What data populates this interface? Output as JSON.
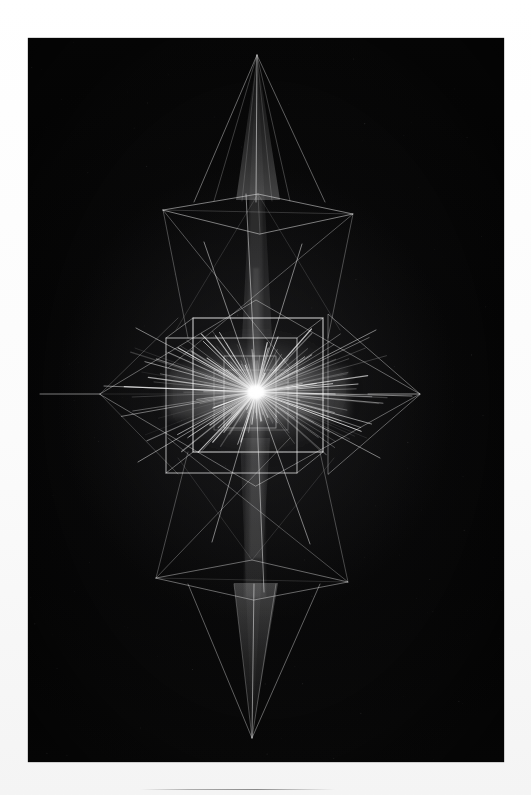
{
  "page": {
    "background_color": "#fdfdfd",
    "width": 531,
    "height": 795
  },
  "photo": {
    "name": "light-painting-photograph",
    "background_color": "#050505",
    "trail_color": "#ffffff",
    "frame": {
      "x": 28,
      "y": 38,
      "width": 476,
      "height": 724
    }
  },
  "paper_rule": {
    "x": 140,
    "y": 789,
    "width": 195
  },
  "chart_data": {
    "type": "scatter",
    "title": "",
    "xlabel": "",
    "ylabel": "",
    "center": {
      "x": 256,
      "y": 392
    },
    "vertices": {
      "top_apex": {
        "x": 257,
        "y": 55
      },
      "bottom_apex": {
        "x": 252,
        "y": 738
      },
      "left_vertex": {
        "x": 100,
        "y": 394
      },
      "right_vertex": {
        "x": 420,
        "y": 393
      },
      "upper_ring_y": 200,
      "lower_ring_y": 580
    },
    "cube": {
      "front_left": 193,
      "front_right": 322,
      "front_top": 318,
      "front_bottom": 452,
      "back_left": 166,
      "back_right": 297,
      "back_top": 337,
      "back_bottom": 472
    },
    "core_glow": {
      "cx": 256,
      "cy": 392,
      "rx": 92,
      "ry": 62
    },
    "ray_count": 168,
    "gridlines": false,
    "legend": false
  }
}
